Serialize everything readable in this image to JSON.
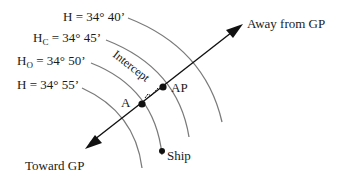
{
  "diagram": {
    "labels": {
      "h_40": {
        "prefix": "H",
        "sub": "",
        "value": " = 34° 40’"
      },
      "h_c": {
        "prefix": "H",
        "sub": "C",
        "value": " =  34° 45’"
      },
      "h_o": {
        "prefix": "H",
        "sub": "O",
        "value": " =  34° 50’"
      },
      "h_55": {
        "prefix": "H",
        "sub": "",
        "value": " = 34° 55’"
      },
      "away": "Away from GP",
      "toward": "Toward GP",
      "intercept": "Intercept",
      "ap": "AP",
      "a": "A",
      "ship": "Ship"
    },
    "colors": {
      "arc": "#7a7a7a",
      "line": "#111111",
      "text": "#1a1a1a"
    }
  }
}
